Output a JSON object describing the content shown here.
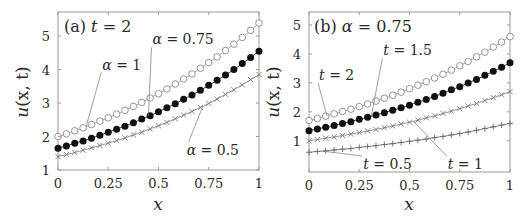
{
  "chart_data": [
    {
      "type": "line",
      "panel": "a",
      "title": "(a) t = 2",
      "xlabel": "x",
      "ylabel": "u(x, t)",
      "xlim": [
        0,
        1
      ],
      "ylim": [
        1,
        5.72
      ],
      "xticks": [
        0,
        0.25,
        0.5,
        0.75,
        1
      ],
      "xtick_labels": [
        "0",
        "0.25",
        "0.5",
        "0.75",
        "1"
      ],
      "yticks": [
        1,
        2,
        3,
        4,
        5
      ],
      "ytick_labels": [
        "1",
        "2",
        "3",
        "4",
        "5"
      ],
      "grid": false,
      "x": [
        0,
        0.0417,
        0.0833,
        0.125,
        0.1667,
        0.2083,
        0.25,
        0.2917,
        0.3333,
        0.375,
        0.4167,
        0.4583,
        0.5,
        0.5417,
        0.5833,
        0.625,
        0.6667,
        0.7083,
        0.75,
        0.7917,
        0.8333,
        0.875,
        0.9167,
        0.9583,
        1
      ],
      "series": [
        {
          "name": "α = 1",
          "marker": "open-circle",
          "color": "#8a8a8a",
          "values": [
            2.0,
            2.08,
            2.17,
            2.26,
            2.36,
            2.46,
            2.56,
            2.67,
            2.78,
            2.9,
            3.02,
            3.15,
            3.28,
            3.42,
            3.57,
            3.72,
            3.87,
            4.04,
            4.21,
            4.38,
            4.57,
            4.76,
            4.96,
            5.17,
            5.39
          ]
        },
        {
          "name": "α = 0.75",
          "marker": "filled-circle",
          "color": "#111111",
          "values": [
            1.65,
            1.72,
            1.8,
            1.87,
            1.95,
            2.04,
            2.13,
            2.22,
            2.31,
            2.41,
            2.52,
            2.62,
            2.74,
            2.86,
            2.98,
            3.11,
            3.24,
            3.38,
            3.53,
            3.68,
            3.84,
            4.0,
            4.18,
            4.36,
            4.55
          ]
        },
        {
          "name": "α = 0.5",
          "marker": "x",
          "color": "#7a7a7a",
          "values": [
            1.4,
            1.46,
            1.52,
            1.59,
            1.66,
            1.73,
            1.8,
            1.88,
            1.96,
            2.05,
            2.13,
            2.23,
            2.32,
            2.42,
            2.53,
            2.64,
            2.75,
            2.87,
            2.99,
            3.12,
            3.26,
            3.4,
            3.54,
            3.7,
            3.85
          ]
        }
      ],
      "annotations": [
        {
          "prefix": "α",
          "text": " = 1",
          "label_xy": [
            0.22,
            4.0
          ],
          "point": [
            0.14,
            2.3
          ]
        },
        {
          "prefix": "α",
          "text": " = 0.75",
          "label_xy": [
            0.47,
            4.75
          ],
          "point": [
            0.45,
            2.61
          ]
        },
        {
          "prefix": "α",
          "text": " = 0.5",
          "label_xy": [
            0.64,
            1.45
          ],
          "point": [
            0.72,
            2.9
          ]
        }
      ]
    },
    {
      "type": "line",
      "panel": "b",
      "title": "(b) α = 0.75",
      "xlabel": "x",
      "ylabel": "u(x, t)",
      "xlim": [
        0,
        1
      ],
      "ylim": [
        -0.08,
        5.45
      ],
      "xticks": [
        0,
        0.25,
        0.5,
        0.75,
        1
      ],
      "xtick_labels": [
        "0",
        "0.25",
        "0.5",
        "0.75",
        "1"
      ],
      "yticks": [
        1,
        2,
        3,
        4,
        5
      ],
      "ytick_labels": [
        "1",
        "2",
        "3",
        "4",
        "5"
      ],
      "grid": false,
      "x": [
        0,
        0.0417,
        0.0833,
        0.125,
        0.1667,
        0.2083,
        0.25,
        0.2917,
        0.3333,
        0.375,
        0.4167,
        0.4583,
        0.5,
        0.5417,
        0.5833,
        0.625,
        0.6667,
        0.7083,
        0.75,
        0.7917,
        0.8333,
        0.875,
        0.9167,
        0.9583,
        1
      ],
      "series": [
        {
          "name": "t = 2",
          "marker": "open-circle",
          "color": "#8a8a8a",
          "values": [
            1.7,
            1.77,
            1.85,
            1.93,
            2.01,
            2.09,
            2.18,
            2.27,
            2.37,
            2.47,
            2.57,
            2.68,
            2.8,
            2.92,
            3.04,
            3.17,
            3.3,
            3.44,
            3.59,
            3.74,
            3.9,
            4.06,
            4.24,
            4.41,
            4.6
          ]
        },
        {
          "name": "t = 1.5",
          "marker": "filled-circle",
          "color": "#111111",
          "values": [
            1.35,
            1.41,
            1.47,
            1.53,
            1.6,
            1.66,
            1.74,
            1.81,
            1.89,
            1.97,
            2.05,
            2.14,
            2.23,
            2.33,
            2.43,
            2.53,
            2.64,
            2.76,
            2.87,
            3.0,
            3.12,
            3.26,
            3.4,
            3.54,
            3.7
          ]
        },
        {
          "name": "t = 1",
          "marker": "x",
          "color": "#7a7a7a",
          "values": [
            1.0,
            1.04,
            1.09,
            1.13,
            1.18,
            1.23,
            1.28,
            1.34,
            1.39,
            1.45,
            1.51,
            1.58,
            1.64,
            1.71,
            1.79,
            1.86,
            1.94,
            2.02,
            2.11,
            2.2,
            2.29,
            2.39,
            2.49,
            2.59,
            2.7
          ]
        },
        {
          "name": "t = 0.5",
          "marker": "plus",
          "color": "#6a6a6a",
          "values": [
            0.6,
            0.63,
            0.65,
            0.68,
            0.71,
            0.73,
            0.77,
            0.8,
            0.83,
            0.87,
            0.9,
            0.94,
            0.98,
            1.02,
            1.06,
            1.11,
            1.15,
            1.2,
            1.25,
            1.3,
            1.36,
            1.42,
            1.48,
            1.54,
            1.6
          ]
        }
      ],
      "annotations": [
        {
          "prefix": "t",
          "text": " = 2",
          "label_xy": [
            0.05,
            3.1
          ],
          "point": [
            0.09,
            1.84
          ]
        },
        {
          "prefix": "t",
          "text": " = 1.5",
          "label_xy": [
            0.37,
            3.95
          ],
          "point": [
            0.31,
            1.85
          ]
        },
        {
          "prefix": "t",
          "text": " = 0.5",
          "label_xy": [
            0.27,
            0.02
          ],
          "point": [
            0.07,
            0.64
          ]
        },
        {
          "prefix": "t",
          "text": " = 1",
          "label_xy": [
            0.69,
            0.02
          ],
          "point": [
            0.52,
            1.67
          ]
        }
      ]
    }
  ],
  "panels": {
    "a": {
      "title_prefix": "(a) ",
      "title_var": "t",
      "title_rest": " = 2"
    },
    "b": {
      "title_prefix": "(b) ",
      "title_var": "α",
      "title_rest": " = 0.75"
    }
  },
  "axis": {
    "xlabel": "x",
    "ylabel_u": "u",
    "ylabel_rest": "(x, t)"
  }
}
